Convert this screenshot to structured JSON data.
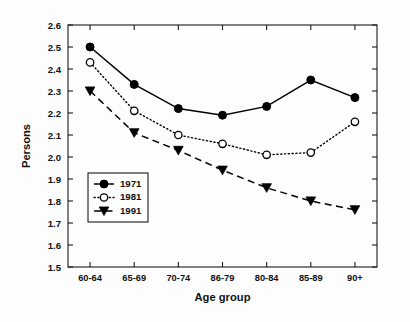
{
  "chart_data": {
    "type": "line",
    "title": "",
    "subtitle": "",
    "xlabel": "Age group",
    "ylabel": "Persons",
    "categories": [
      "60-64",
      "65-69",
      "70-74",
      "86-79",
      "80-84",
      "85-89",
      "90+"
    ],
    "ylim": [
      1.5,
      2.6
    ],
    "yticks": [
      "1.5",
      "1.6",
      "1.7",
      "1.8",
      "1.9",
      "2.0",
      "2.1",
      "2.2",
      "2.3",
      "2.4",
      "2.5",
      "2.6"
    ],
    "ytick_values": [
      1.5,
      1.6,
      1.7,
      1.8,
      1.9,
      2.0,
      2.1,
      2.2,
      2.3,
      2.4,
      2.5,
      2.6
    ],
    "grid": false,
    "legend_position": "lower-left-inside",
    "series": [
      {
        "name": "1971",
        "marker": "filled-circle",
        "linestyle": "solid",
        "color": "#000000",
        "values": [
          2.5,
          2.33,
          2.22,
          2.19,
          2.23,
          2.35,
          2.27
        ]
      },
      {
        "name": "1981",
        "marker": "open-circle",
        "linestyle": "dotted",
        "color": "#000000",
        "values": [
          2.43,
          2.21,
          2.1,
          2.06,
          2.01,
          2.02,
          2.16
        ]
      },
      {
        "name": "1991",
        "marker": "filled-triangle-down",
        "linestyle": "dashed",
        "color": "#000000",
        "values": [
          2.3,
          2.11,
          2.03,
          1.94,
          1.86,
          1.8,
          1.76
        ]
      }
    ]
  },
  "legend": {
    "entries": [
      {
        "label": "1971"
      },
      {
        "label": "1981"
      },
      {
        "label": "1991"
      }
    ]
  }
}
